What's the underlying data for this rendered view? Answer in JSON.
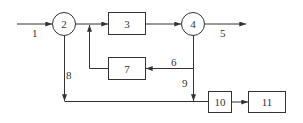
{
  "diagram": {
    "type": "process flow / block diagram",
    "nodes": {
      "n2": {
        "label": "2",
        "shape": "circle"
      },
      "n3": {
        "label": "3",
        "shape": "box"
      },
      "n4": {
        "label": "4",
        "shape": "circle"
      },
      "n7": {
        "label": "7",
        "shape": "box"
      },
      "n10": {
        "label": "10",
        "shape": "box"
      },
      "n11": {
        "label": "11",
        "shape": "box"
      }
    },
    "streams": {
      "s1": {
        "label": "1",
        "from": "input",
        "to": "2"
      },
      "s5": {
        "label": "5",
        "from": "4",
        "to": "output"
      },
      "s6": {
        "label": "6",
        "from": "4",
        "to": "7"
      },
      "s8": {
        "label": "8",
        "from": "2",
        "to": "10"
      },
      "s9": {
        "label": "9",
        "from": "4",
        "to": "10"
      }
    },
    "edges_unlabeled": [
      {
        "from": "2",
        "to": "3"
      },
      {
        "from": "3",
        "to": "4"
      },
      {
        "from": "7",
        "to": "3 (recycle, joins before 3)"
      },
      {
        "from": "10",
        "to": "11"
      }
    ]
  }
}
